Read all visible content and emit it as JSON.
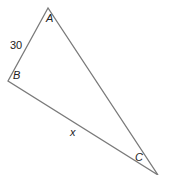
{
  "diagram": {
    "type": "triangle",
    "vertices": {
      "A": {
        "label": "A",
        "x": 48,
        "y": 8
      },
      "B": {
        "label": "B",
        "x": 8,
        "y": 81
      },
      "C": {
        "label": "C",
        "x": 158,
        "y": 175
      }
    },
    "sides": {
      "AB": {
        "label": "30"
      },
      "BC": {
        "label": "x"
      }
    },
    "stroke_color": "#7a7a7a"
  }
}
